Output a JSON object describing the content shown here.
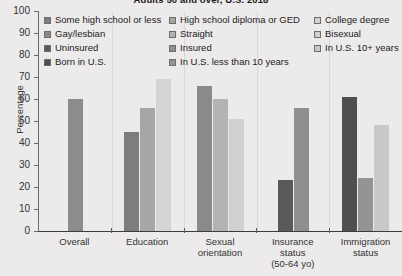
{
  "chart_data": {
    "type": "bar",
    "title": "Adults 50 and over, U.S. 2018",
    "xlabel": "",
    "ylabel": "Percentage",
    "ylim": [
      0,
      100
    ],
    "yticks": [
      0,
      10,
      20,
      30,
      40,
      50,
      60,
      70,
      80,
      90,
      100
    ],
    "grid": false,
    "legend_position": "top",
    "categories": [
      "Overall",
      "Education",
      "Sexual orientation",
      "Insurance status (50-64 yo)",
      "Immigration status"
    ],
    "groups": [
      {
        "label": "Overall",
        "label_lines": [
          "Overall"
        ],
        "bars": [
          {
            "name": "Overall",
            "value": 60,
            "color": "#8c8c8c"
          }
        ]
      },
      {
        "label": "Education",
        "label_lines": [
          "Education"
        ],
        "bars": [
          {
            "name": "Some high school or less",
            "value": 45,
            "color": "#7d7d7d"
          },
          {
            "name": "High school diploma or GED",
            "value": 56,
            "color": "#a6a6a6"
          },
          {
            "name": "College degree",
            "value": 69,
            "color": "#d4d4d4"
          }
        ]
      },
      {
        "label": "Sexual orientation",
        "label_lines": [
          "Sexual",
          "orientation"
        ],
        "bars": [
          {
            "name": "Gay/lesbian",
            "value": 66,
            "color": "#8a8a8a"
          },
          {
            "name": "Straight",
            "value": 60,
            "color": "#b3b3b3"
          },
          {
            "name": "Bisexual",
            "value": 51,
            "color": "#d0d0d0"
          }
        ]
      },
      {
        "label": "Insurance status (50-64 yo)",
        "label_lines": [
          "Insurance",
          "status",
          "(50-64 yo)"
        ],
        "bars": [
          {
            "name": "Uninsured",
            "value": 23,
            "color": "#595959"
          },
          {
            "name": "Insured",
            "value": 56,
            "color": "#8f8f8f"
          }
        ]
      },
      {
        "label": "Immigration status",
        "label_lines": [
          "Immigration",
          "status"
        ],
        "bars": [
          {
            "name": "Born in U.S.",
            "value": 61,
            "color": "#4f4f4f"
          },
          {
            "name": "In U.S. less than 10 years",
            "value": 24,
            "color": "#949494"
          },
          {
            "name": "In U.S. 10+ years",
            "value": 48,
            "color": "#c9c9c9"
          }
        ]
      }
    ],
    "legend": [
      {
        "label": "Some high school or less",
        "color": "#7d7d7d"
      },
      {
        "label": "High school diploma or GED",
        "color": "#a6a6a6"
      },
      {
        "label": "College degree",
        "color": "#d4d4d4"
      },
      {
        "label": "Gay/lesbian",
        "color": "#8a8a8a"
      },
      {
        "label": "Straight",
        "color": "#b3b3b3"
      },
      {
        "label": "Bisexual",
        "color": "#d0d0d0"
      },
      {
        "label": "Uninsured",
        "color": "#595959"
      },
      {
        "label": "Insured",
        "color": "#8f8f8f"
      },
      {
        "label": "In U.S. 10+ years",
        "color": "#c9c9c9"
      },
      {
        "label": "Born in U.S.",
        "color": "#4f4f4f"
      },
      {
        "label": "In U.S. less than 10 years",
        "color": "#949494"
      }
    ]
  }
}
